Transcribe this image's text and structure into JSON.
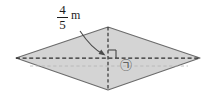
{
  "figure": {
    "shape_name": "rhombus",
    "fill_color": "#d4d4d4",
    "stroke_color": "#6b6b6b",
    "dash_color": "#2b2b2b",
    "faint_dash_color": "#b0b0b0",
    "background_color": "#ffffff",
    "vertices": {
      "left": [
        16,
        58
      ],
      "top": [
        108,
        27
      ],
      "right": [
        200,
        58
      ],
      "bottom": [
        108,
        90
      ]
    }
  },
  "measurement": {
    "numerator": "4",
    "denominator": "5",
    "unit": "m",
    "full_text": "4/5 m",
    "arrow_name": "curved-leader-arrow"
  },
  "annotations": {
    "right_angle_marker": "right-angle",
    "region_mark": "㉠",
    "region_mark_name": "circled-giyeok"
  },
  "icons": {
    "right_angle_icon": "right-angle-icon",
    "arrow_icon": "curved-arrow-icon"
  }
}
